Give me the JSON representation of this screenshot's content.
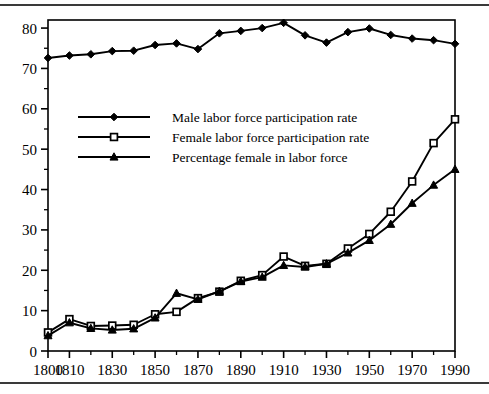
{
  "figure": {
    "background": "#ffffff",
    "ink_color": "#000000",
    "rule_color": "#3a3a3a"
  },
  "chart_data": {
    "type": "line",
    "title": "",
    "subtitle": "",
    "xlabel": "",
    "ylabel": "",
    "xlim": [
      1800,
      1990
    ],
    "ylim": [
      0,
      82
    ],
    "grid": false,
    "legend_position": "upper-left-inside",
    "x_tick_labels": [
      "1800",
      "1810",
      "1830",
      "1850",
      "1870",
      "1890",
      "1910",
      "1930",
      "1950",
      "1970",
      "1990"
    ],
    "x_tick_values": [
      1800,
      1810,
      1830,
      1850,
      1870,
      1890,
      1910,
      1930,
      1950,
      1970,
      1990
    ],
    "x_minor_ticks": [
      1820,
      1840,
      1860,
      1880,
      1900,
      1920,
      1940,
      1960,
      1980
    ],
    "y_tick_labels": [
      "0",
      "10",
      "20",
      "30",
      "40",
      "50",
      "60",
      "70",
      "80"
    ],
    "y_tick_values": [
      0,
      10,
      20,
      30,
      40,
      50,
      60,
      70,
      80
    ],
    "y_minor_ticks": [
      5,
      15,
      25,
      35,
      45,
      55,
      65,
      75
    ],
    "x": [
      1800,
      1810,
      1820,
      1830,
      1840,
      1850,
      1860,
      1870,
      1880,
      1890,
      1900,
      1910,
      1920,
      1930,
      1940,
      1950,
      1960,
      1970,
      1980,
      1990
    ],
    "series": [
      {
        "name": "Male labor force participation rate",
        "marker": "filled-diamond",
        "values": [
          72.6,
          73.2,
          73.5,
          74.3,
          74.4,
          75.8,
          76.2,
          74.8,
          78.7,
          79.3,
          80.0,
          81.3,
          78.2,
          76.4,
          79.0,
          79.9,
          78.3,
          77.4,
          77.0,
          76.1
        ]
      },
      {
        "name": "Female labor force participation rate",
        "marker": "open-square",
        "values": [
          4.6,
          7.9,
          6.2,
          6.3,
          6.5,
          9.1,
          9.7,
          13.1,
          14.7,
          17.4,
          18.8,
          23.4,
          21.1,
          21.6,
          25.4,
          29.0,
          34.5,
          42.0,
          51.5,
          57.4
        ]
      },
      {
        "name": "Percentage female in labor force",
        "marker": "filled-triangle",
        "values": [
          3.8,
          7.0,
          5.6,
          5.2,
          5.5,
          8.2,
          14.3,
          12.8,
          14.8,
          17.2,
          18.3,
          21.2,
          20.8,
          21.6,
          24.3,
          27.4,
          31.4,
          36.6,
          41.1,
          45.0
        ]
      }
    ],
    "legend": [
      {
        "label": "Male labor force participation rate",
        "marker": "filled-diamond"
      },
      {
        "label": "Female labor force participation rate",
        "marker": "open-square"
      },
      {
        "label": "Percentage female in labor force",
        "marker": "filled-triangle"
      }
    ]
  }
}
